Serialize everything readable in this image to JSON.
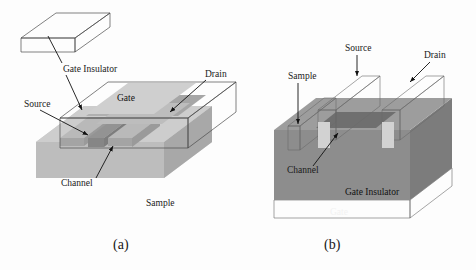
{
  "figure": {
    "background_color": "#fdfdfd",
    "captions": [
      {
        "id": "a",
        "text": "(a)",
        "x": 113,
        "y": 249
      },
      {
        "id": "b",
        "text": "(b)",
        "x": 324,
        "y": 249
      }
    ]
  },
  "panel_a": {
    "name": "top-gate-transistor",
    "labels": {
      "gate_insulator": "Gate Insulator",
      "source": "Source",
      "drain": "Drain",
      "gate": "Gate",
      "channel": "Channel",
      "sample": "Sample"
    },
    "colors": {
      "sample_top": "#c9c9c9",
      "sample_front": "#bcbcbc",
      "sample_side": "#a9a9a9",
      "insulator_top": "#e9e9e9",
      "insulator_front": "#f3f3f3",
      "electrode": "#b3b3b3",
      "electrode_dark": "#9d9d9d",
      "channel": "#8f8f8f",
      "outline": "#4a4a4a",
      "inset_box": "#ffffff"
    }
  },
  "panel_b": {
    "name": "bottom-gate-transistor",
    "labels": {
      "sample": "Sample",
      "source": "Source",
      "drain": "Drain",
      "channel": "Channel",
      "gate_insulator": "Gate Insulator",
      "gate": "Gate"
    },
    "colors": {
      "insulator_front": "#8c8c8c",
      "insulator_top": "#9a9a9a",
      "insulator_side": "#7d7d7d",
      "gate_layer": "#c6c6c6",
      "bar_top": "#d6d6d6",
      "bar_face": "#a8a8a8",
      "bar_side": "#bdbdbd",
      "channel": "#6f6f6f",
      "outline": "#5a5a5a"
    }
  }
}
